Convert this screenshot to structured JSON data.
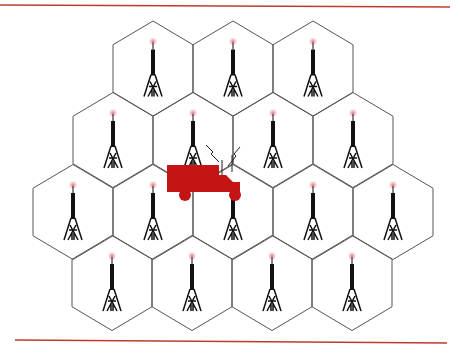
{
  "figure": {
    "title": "Cellular network: hexagonal cells each with a base-station tower, mobile vehicle crossing cells",
    "colors": {
      "rule": "#c0392b",
      "cell_stroke": "#555555",
      "tower": "#111111",
      "tower_glow": "#f4a0a8",
      "vehicle": "#c41414",
      "signal": "#222222"
    },
    "rules": [
      {
        "name": "top-rule",
        "x1": 0,
        "y1": 5,
        "x2": 450,
        "y2": 7
      },
      {
        "name": "bottom-rule",
        "x1": 15,
        "y1": 340,
        "x2": 447,
        "y2": 343
      }
    ],
    "cell": {
      "half_width": 40,
      "radius": 47.5
    },
    "cells": [
      {
        "row": 1,
        "cx": 153,
        "cy": 68.5
      },
      {
        "row": 1,
        "cx": 233,
        "cy": 68.5
      },
      {
        "row": 1,
        "cx": 313,
        "cy": 68.5
      },
      {
        "row": 2,
        "cx": 113,
        "cy": 140
      },
      {
        "row": 2,
        "cx": 193,
        "cy": 140
      },
      {
        "row": 2,
        "cx": 273,
        "cy": 140
      },
      {
        "row": 2,
        "cx": 353,
        "cy": 140
      },
      {
        "row": 3,
        "cx": 73,
        "cy": 212
      },
      {
        "row": 3,
        "cx": 153,
        "cy": 212
      },
      {
        "row": 3,
        "cx": 233,
        "cy": 212
      },
      {
        "row": 3,
        "cx": 313,
        "cy": 212
      },
      {
        "row": 3,
        "cx": 393,
        "cy": 212
      },
      {
        "row": 4,
        "cx": 112,
        "cy": 283
      },
      {
        "row": 4,
        "cx": 192,
        "cy": 283
      },
      {
        "row": 4,
        "cx": 272,
        "cy": 283
      },
      {
        "row": 4,
        "cx": 352,
        "cy": 283
      }
    ],
    "cell_count": 16,
    "tower_label": "base-station tower",
    "vehicle": {
      "label": "mobile vehicle (truck) with antennas",
      "box": {
        "x": 167,
        "y": 165,
        "w": 52,
        "h": 27
      },
      "wheels": [
        {
          "cx": 185,
          "cy": 195,
          "r": 6
        },
        {
          "cx": 235,
          "cy": 195,
          "r": 6
        }
      ]
    }
  }
}
